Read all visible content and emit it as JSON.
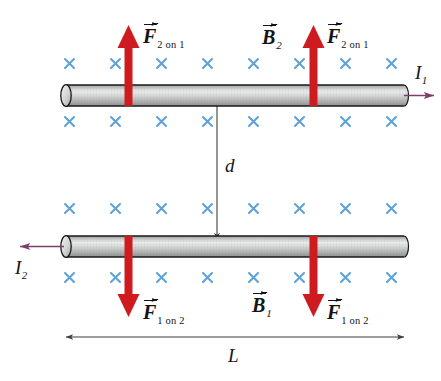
{
  "figure": {
    "cut_off_caption": "",
    "background_color": "#ffffff"
  },
  "colors": {
    "force_arrow": "#CE1B20",
    "current_arrow": "#7B3F6E",
    "field_cross": "#5FA2D9",
    "wire_body": "#C9CBCA",
    "wire_outline": "#1a1a1a",
    "dimension_line": "#4a4a4a",
    "text": "#141414"
  },
  "wires": {
    "top": {
      "name": "wire-1",
      "current_label": "I",
      "current_subscript": "1",
      "current_direction": "right"
    },
    "bottom": {
      "name": "wire-2",
      "current_label": "I",
      "current_subscript": "2",
      "current_direction": "left"
    }
  },
  "labels": {
    "force_on_1_left": {
      "symbol": "F",
      "subscript": "2 on 1"
    },
    "force_on_1_right": {
      "symbol": "F",
      "subscript": "2 on 1"
    },
    "force_on_2_left": {
      "symbol": "F",
      "subscript": "1 on 2"
    },
    "force_on_2_right": {
      "symbol": "F",
      "subscript": "1 on 2"
    },
    "field_b2": {
      "symbol": "B",
      "subscript": "2"
    },
    "field_b1": {
      "symbol": "B",
      "subscript": "1"
    },
    "separation": "d",
    "length": "L"
  },
  "field_region": {
    "symbol": "x",
    "meaning": "magnetic-field-into-page",
    "rows": 4,
    "crosses_per_row": 8,
    "row_labels": [
      "field-row-above-wire-1",
      "field-row-below-wire-1",
      "field-row-above-wire-2",
      "field-row-below-wire-2"
    ]
  },
  "force_arrows": {
    "top_wire": {
      "direction": "up",
      "count": 2
    },
    "bottom_wire": {
      "direction": "down",
      "count": 2
    }
  },
  "dimensions": {
    "separation_arrow": {
      "label": "d",
      "orientation": "vertical",
      "double_headed": true
    },
    "length_arrow": {
      "label": "L",
      "orientation": "horizontal",
      "double_headed": true
    }
  }
}
